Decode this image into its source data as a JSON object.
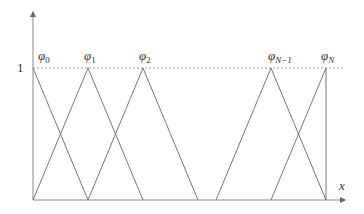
{
  "diagram": {
    "y_tick_label": "1",
    "x_axis_label": "x",
    "basis_labels": [
      {
        "base": "φ",
        "sub": "0"
      },
      {
        "base": "φ",
        "sub": "1"
      },
      {
        "base": "φ",
        "sub": "2"
      },
      {
        "base": "φ",
        "sub": "N−1"
      },
      {
        "base": "φ",
        "sub": "N"
      }
    ],
    "colors": {
      "line": "#777777",
      "axis": "#888888",
      "dashed": "#888888",
      "text": "#333333"
    }
  }
}
